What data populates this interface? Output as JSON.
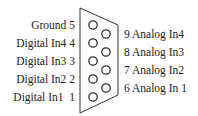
{
  "diagram": {
    "type": "DB9 connector pinout",
    "left_pins": [
      {
        "pin": 5,
        "label": "Ground 5",
        "top": 18
      },
      {
        "pin": 4,
        "label": "Digital In4 4",
        "top": 36
      },
      {
        "pin": 3,
        "label": "Digital In3 3",
        "top": 54
      },
      {
        "pin": 2,
        "label": "Digital In2 2",
        "top": 72
      },
      {
        "pin": 1,
        "label": "Digital In1  1",
        "top": 90
      }
    ],
    "right_pins": [
      {
        "pin": 9,
        "label": "9 Analog In4",
        "top": 27
      },
      {
        "pin": 8,
        "label": "8 Analog In3",
        "top": 45
      },
      {
        "pin": 7,
        "label": "7 Analog In2",
        "top": 63
      },
      {
        "pin": 6,
        "label": "6 Analog In 1",
        "top": 81
      }
    ],
    "colors": {
      "stroke": "#333333",
      "text": "#222222",
      "background": "#ffffff"
    }
  }
}
